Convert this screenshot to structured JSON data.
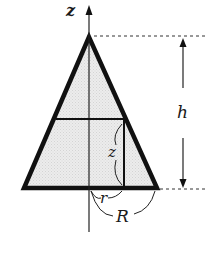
{
  "diagram": {
    "labels": {
      "axis": "z",
      "height": "h",
      "inner_height": "z",
      "inner_radius": "r",
      "outer_radius": "R"
    },
    "colors": {
      "stroke": "#111111",
      "fill": "#e6e6e6",
      "background": "#ffffff"
    }
  }
}
